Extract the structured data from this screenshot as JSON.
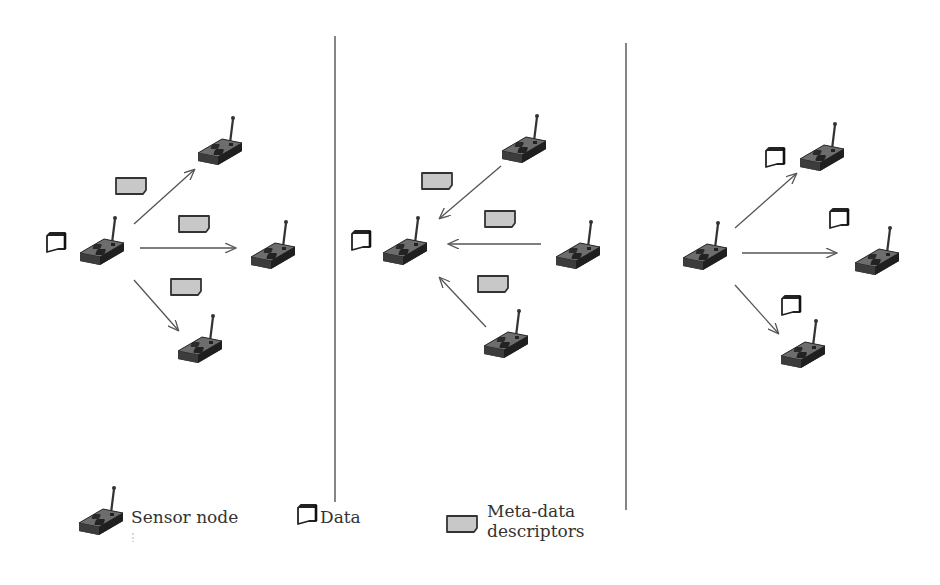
{
  "legend": {
    "sensor_node": "Sensor node",
    "data": "Data",
    "metadata_line1": "Meta-data",
    "metadata_line2": "descriptors"
  },
  "panels": [
    {
      "name": "advertise",
      "description": "Source node with data broadcasts meta-data descriptors to neighbors",
      "source": {
        "x": 100,
        "y": 245,
        "has_data": true
      },
      "neighbors": [
        {
          "x": 218,
          "y": 145
        },
        {
          "x": 272,
          "y": 250
        },
        {
          "x": 198,
          "y": 345
        }
      ],
      "arrow_direction": "outgoing",
      "payload": "metadata"
    },
    {
      "name": "request",
      "description": "Neighbors send meta-data descriptors back to source",
      "source": {
        "x": 400,
        "y": 245,
        "has_data": true
      },
      "neighbors": [
        {
          "x": 522,
          "y": 145
        },
        {
          "x": 578,
          "y": 250
        },
        {
          "x": 505,
          "y": 340
        }
      ],
      "arrow_direction": "incoming",
      "payload": "metadata"
    },
    {
      "name": "transmit",
      "description": "Source sends data to requesting neighbors",
      "source": {
        "x": 703,
        "y": 250,
        "has_data": false
      },
      "neighbors": [
        {
          "x": 822,
          "y": 150
        },
        {
          "x": 877,
          "y": 255
        },
        {
          "x": 802,
          "y": 345
        }
      ],
      "arrow_direction": "outgoing",
      "payload": "data"
    }
  ],
  "colors": {
    "node_body": "#3a3a3a",
    "node_top": "#6a6a6a",
    "metadata_fill": "#c8c8c8",
    "line": "#555555"
  }
}
